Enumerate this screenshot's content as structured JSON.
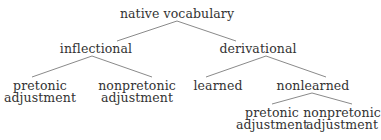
{
  "diagram": {
    "type": "tree",
    "colors": {
      "text": "#333333",
      "edge": "#8a8a8a",
      "background": "#ffffff"
    },
    "root": {
      "label": "native vocabulary",
      "children": [
        {
          "label": "inflectional",
          "children": [
            {
              "label_lines": [
                "pretonic",
                "adjustment"
              ]
            },
            {
              "label_lines": [
                "nonpretonic",
                "adjustment"
              ]
            }
          ]
        },
        {
          "label": "derivational",
          "children": [
            {
              "label": "learned"
            },
            {
              "label": "nonlearned",
              "children": [
                {
                  "label_lines": [
                    "pretonic",
                    "adjustment"
                  ]
                },
                {
                  "label_lines": [
                    "nonpretonic",
                    "adjustment"
                  ]
                }
              ]
            }
          ]
        }
      ]
    }
  }
}
